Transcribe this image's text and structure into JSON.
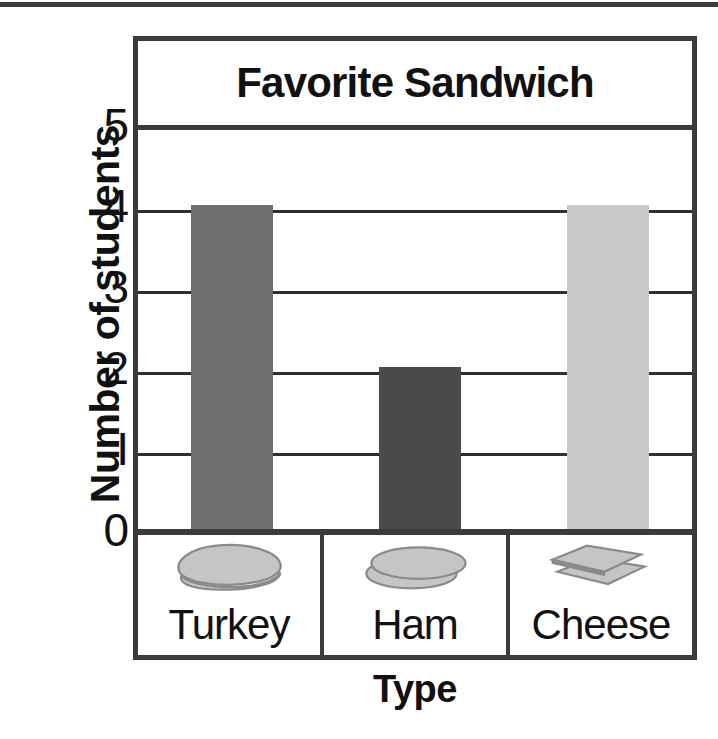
{
  "chart_data": {
    "type": "bar",
    "title": "Favorite Sandwich",
    "xlabel": "Type",
    "ylabel": "Number of students",
    "categories": [
      "Turkey",
      "Ham",
      "Cheese"
    ],
    "values": [
      4,
      2,
      4
    ],
    "ylim": [
      0,
      5
    ],
    "ytick_labels": [
      "5",
      "4",
      "3",
      "2",
      "I",
      "0"
    ],
    "ytick_values": [
      5,
      4,
      3,
      2,
      1,
      0
    ],
    "grid": true,
    "legend": "none",
    "bar_colors": [
      "#6e6e6e",
      "#4a4a4a",
      "#c9c9c9"
    ],
    "category_icons": [
      "turkey-slice-icon",
      "ham-slice-icon",
      "cheese-slice-icon"
    ]
  },
  "style": {
    "frame_color": "#3b3b3b",
    "gridline_color": "#2d2d2d",
    "background": "#ffffff",
    "text_color": "#111111",
    "icon_fill": "#c5c5c5",
    "icon_stroke": "#8a8a8a"
  }
}
